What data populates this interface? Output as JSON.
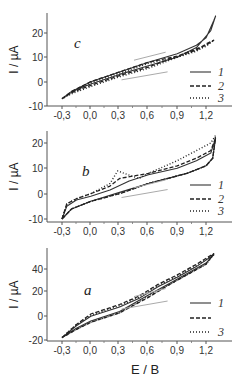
{
  "chart_data": [
    {
      "type": "line",
      "panel": "c",
      "xlabel": "",
      "ylabel": "I / µA",
      "xlim": [
        -0.35,
        1.32
      ],
      "ylim": [
        -10,
        28
      ],
      "xticks": [
        "-0,3",
        "0,0",
        "0,3",
        "0,6",
        "0,9",
        "1,2"
      ],
      "yticks": [
        "-10",
        "0",
        "10",
        "20"
      ],
      "legend": [
        "1",
        "2",
        "3"
      ],
      "legend_position": "right",
      "series": [
        {
          "name": "1",
          "style": "solid",
          "x": [
            -0.3,
            -0.2,
            0.0,
            0.3,
            0.6,
            0.9,
            1.1,
            1.2,
            1.28,
            1.3,
            1.25,
            1.1,
            0.9,
            0.6,
            0.3,
            0.0,
            -0.2,
            -0.3
          ],
          "y": [
            -7,
            -4,
            0,
            4,
            8,
            11.5,
            15,
            18,
            25,
            27,
            21,
            14,
            10,
            6.5,
            3,
            -1,
            -4,
            -7
          ]
        },
        {
          "name": "2",
          "style": "dashed",
          "x": [
            -0.3,
            -0.2,
            0.0,
            0.3,
            0.6,
            0.9,
            1.1,
            1.2,
            1.28,
            1.2,
            1.0,
            0.6,
            0.3,
            0.0,
            -0.2,
            -0.3
          ],
          "y": [
            -7,
            -4,
            0,
            4,
            8,
            10.5,
            13,
            15.5,
            17,
            15,
            12,
            6,
            2.5,
            -1.5,
            -4.5,
            -7
          ]
        },
        {
          "name": "3",
          "style": "dotted",
          "x": [
            -0.3,
            -0.2,
            0.0,
            0.3,
            0.6,
            0.9,
            1.1,
            1.2,
            1.28,
            1.2,
            1.0,
            0.6,
            0.3,
            0.0,
            -0.2,
            -0.3
          ],
          "y": [
            -7,
            -4.5,
            -0.5,
            3.5,
            7.5,
            10,
            12.5,
            15,
            17,
            14.5,
            11.5,
            5.5,
            2,
            -2,
            -5,
            -7
          ]
        }
      ]
    },
    {
      "type": "line",
      "panel": "b",
      "xlabel": "",
      "ylabel": "I / µA",
      "xlim": [
        -0.35,
        1.32
      ],
      "ylim": [
        -11,
        24
      ],
      "xticks": [
        "-0,3",
        "0,0",
        "0,3",
        "0,6",
        "0,9",
        "1,2"
      ],
      "yticks": [
        "-10",
        "0",
        "10",
        "20"
      ],
      "legend": [
        "1",
        "2",
        "3"
      ],
      "legend_position": "right",
      "series": [
        {
          "name": "1",
          "style": "solid",
          "x": [
            -0.3,
            -0.25,
            -0.15,
            0.0,
            0.2,
            0.4,
            0.6,
            0.9,
            1.1,
            1.25,
            1.3,
            1.27,
            1.2,
            1.0,
            0.6,
            0.3,
            0.0,
            -0.2,
            -0.3
          ],
          "y": [
            -10,
            -5,
            -2.5,
            -1,
            1.5,
            5,
            7.5,
            10,
            13,
            16,
            22,
            14,
            11,
            8,
            4,
            0.5,
            -3,
            -6,
            -10
          ]
        },
        {
          "name": "2",
          "style": "dashed",
          "x": [
            -0.3,
            -0.25,
            -0.15,
            0.0,
            0.2,
            0.3,
            0.45,
            0.6,
            0.9,
            1.1,
            1.25,
            1.3,
            1.27,
            1.2,
            1.0,
            0.6,
            0.3,
            0.0,
            -0.2,
            -0.3
          ],
          "y": [
            -10,
            -4,
            -2,
            0,
            3,
            6,
            7,
            8,
            11,
            14,
            17,
            22,
            14,
            11,
            8,
            4,
            0,
            -3,
            -6,
            -10
          ]
        },
        {
          "name": "3",
          "style": "dotted",
          "x": [
            -0.3,
            -0.25,
            -0.15,
            0.0,
            0.2,
            0.28,
            0.35,
            0.5,
            0.6,
            0.9,
            1.1,
            1.25,
            1.3,
            1.27,
            1.2,
            1.0,
            0.6,
            0.3,
            0.0,
            -0.2,
            -0.3
          ],
          "y": [
            -10,
            -4,
            -2,
            0,
            4,
            9,
            8,
            6,
            8,
            13,
            17,
            20,
            23,
            14,
            11,
            8,
            4,
            0,
            -3,
            -6,
            -10
          ]
        }
      ]
    },
    {
      "type": "line",
      "panel": "a",
      "xlabel": "E / B",
      "ylabel": "I / µA",
      "xlim": [
        -0.35,
        1.32
      ],
      "ylim": [
        -20,
        57
      ],
      "xticks": [
        "-0,3",
        "0,0",
        "0,3",
        "0,6",
        "0,9",
        "1,2"
      ],
      "yticks": [
        "-20",
        "0",
        "20",
        "40"
      ],
      "legend": [
        "1",
        "",
        "3"
      ],
      "legend_position": "right",
      "series": [
        {
          "name": "1",
          "style": "solid",
          "x": [
            -0.3,
            -0.15,
            0.0,
            0.3,
            0.5,
            0.7,
            0.9,
            1.1,
            1.28,
            1.2,
            1.0,
            0.8,
            0.6,
            0.3,
            0.0,
            -0.15,
            -0.3
          ],
          "y": [
            -18,
            -8,
            0,
            8,
            15,
            25,
            33,
            42,
            52,
            45,
            36,
            27,
            18,
            4,
            -4,
            -10,
            -18
          ]
        },
        {
          "name": "2",
          "style": "dashed",
          "x": [
            -0.3,
            -0.15,
            0.0,
            0.3,
            0.5,
            0.7,
            0.9,
            1.1,
            1.28,
            1.2,
            1.0,
            0.8,
            0.6,
            0.3,
            0.0,
            -0.15,
            -0.3
          ],
          "y": [
            -18,
            -7,
            2,
            10,
            17,
            27,
            35,
            44,
            53,
            44,
            35,
            26,
            16,
            3,
            -5,
            -11,
            -18
          ]
        },
        {
          "name": "3",
          "style": "dotted",
          "x": [
            -0.3,
            -0.15,
            0.0,
            0.3,
            0.5,
            0.7,
            0.9,
            1.1,
            1.28,
            1.2,
            1.0,
            0.8,
            0.6,
            0.3,
            0.0,
            -0.15,
            -0.3
          ],
          "y": [
            -18,
            -7,
            1,
            9,
            16,
            26,
            34,
            43,
            52,
            44,
            35,
            26,
            17,
            3,
            -5,
            -11,
            -18
          ]
        }
      ]
    }
  ],
  "panels": [
    {
      "label": "c",
      "ylabel": "I / µA"
    },
    {
      "label": "b",
      "ylabel": "I / µA"
    },
    {
      "label": "a",
      "ylabel": "I / µA"
    }
  ],
  "x_axis_title": "E / B"
}
